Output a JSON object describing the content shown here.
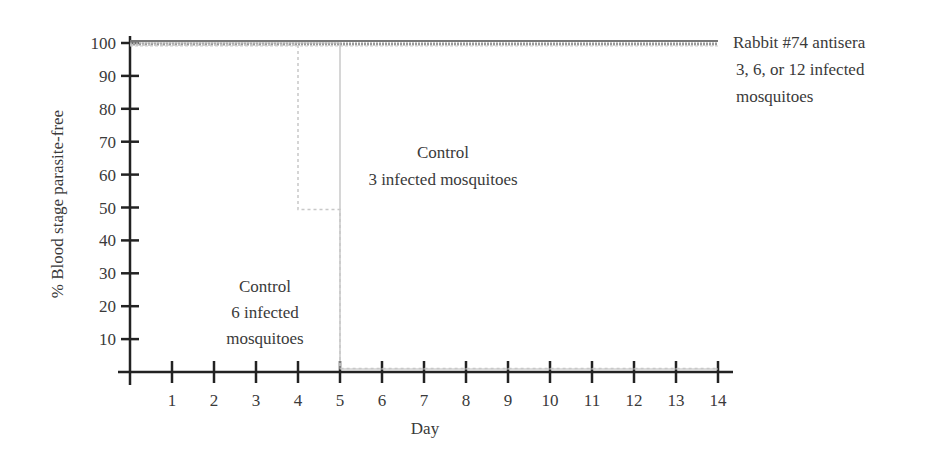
{
  "chart_data": {
    "type": "line",
    "title": "",
    "xlabel": "Day",
    "ylabel": "% Blood stage parasite-free",
    "xlim": [
      0,
      14
    ],
    "ylim": [
      0,
      100
    ],
    "x_ticks": [
      1,
      2,
      3,
      4,
      5,
      6,
      7,
      8,
      9,
      10,
      11,
      12,
      13,
      14
    ],
    "y_ticks": [
      10,
      20,
      30,
      40,
      50,
      60,
      70,
      80,
      90,
      100
    ],
    "grid": false,
    "legend": "inline annotations",
    "series": [
      {
        "name": "Rabbit #74 antisera 3, 6, or 12 infected mosquitoes",
        "style": "solid + hatched (multiple overlapping)",
        "x": [
          0,
          14
        ],
        "y": [
          100,
          100
        ]
      },
      {
        "name": "Control 3 infected mosquitoes",
        "style": "thin solid light gray",
        "x": [
          0,
          5,
          5,
          14
        ],
        "y": [
          100,
          100,
          0,
          0
        ]
      },
      {
        "name": "Control 6 infected mosquitoes",
        "style": "dotted light gray",
        "x": [
          0,
          4,
          4,
          5,
          5,
          14
        ],
        "y": [
          100,
          100,
          50,
          50,
          0,
          0
        ]
      }
    ],
    "annotations": [
      {
        "lines": [
          "Rabbit #74 antisera",
          "3, 6, or 12 infected",
          "mosquitoes"
        ]
      },
      {
        "lines": [
          "Control",
          "3 infected mosquitoes"
        ]
      },
      {
        "lines": [
          "Control",
          "6 infected",
          "mosquitoes"
        ]
      }
    ]
  },
  "labels": {
    "xlabel": "Day",
    "ylabel": "% Blood stage parasite-free",
    "rabbit_1": "Rabbit #74 antisera",
    "rabbit_2": "3, 6, or 12 infected",
    "rabbit_3": "mosquitoes",
    "c3_1": "Control",
    "c3_2": "3 infected mosquitoes",
    "c6_1": "Control",
    "c6_2": "6 infected",
    "c6_3": "mosquitoes"
  }
}
